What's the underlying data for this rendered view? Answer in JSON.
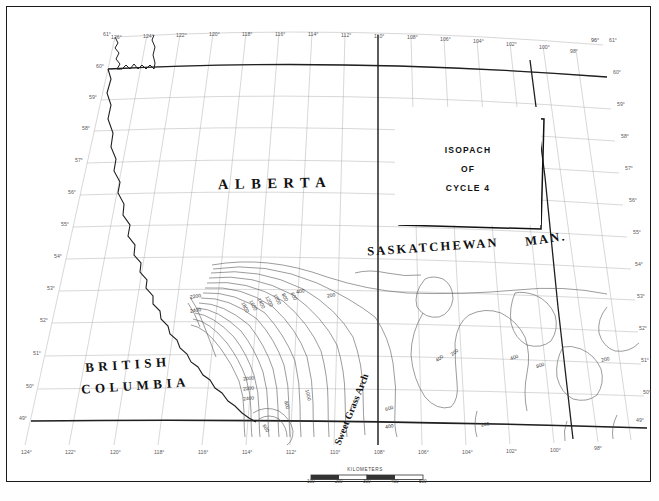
{
  "map": {
    "title_box": {
      "lines": [
        "ISOPACH",
        "OF",
        "CYCLE 4"
      ]
    },
    "provinces": [
      {
        "name": "alberta",
        "label": "ALBERTA"
      },
      {
        "name": "saskatchewan",
        "label": "SASKATCHEWAN"
      },
      {
        "name": "manitoba",
        "label": "MAN."
      },
      {
        "name": "british-columbia-line1",
        "label": "BRITISH"
      },
      {
        "name": "british-columbia-line2",
        "label": "COLUMBIA"
      }
    ],
    "feature_labels": [
      {
        "name": "sweet-grass-arch",
        "label": "Sweet Grass Arch"
      }
    ],
    "longitude_labels_top": [
      "126°",
      "124°",
      "122°",
      "120°",
      "118°",
      "116°",
      "114°",
      "112°",
      "110°",
      "108°",
      "106°",
      "104°",
      "102°",
      "100°",
      "98°",
      "96°"
    ],
    "longitude_labels_bottom": [
      "124°",
      "122°",
      "120°",
      "118°",
      "116°",
      "114°",
      "112°",
      "110°",
      "108°",
      "106°",
      "104°",
      "102°",
      "100°",
      "98°"
    ],
    "latitude_labels_left": [
      "61°",
      "60°",
      "59°",
      "58°",
      "57°",
      "56°",
      "55°",
      "54°",
      "53°",
      "52°",
      "51°",
      "50°",
      "49°"
    ],
    "latitude_labels_right": [
      "61°",
      "60°",
      "59°",
      "58°",
      "57°",
      "56°",
      "55°",
      "54°",
      "53°",
      "52°",
      "51°",
      "50°",
      "49°"
    ],
    "contour_labels": [
      "2200",
      "2400",
      "400",
      "200",
      "1800",
      "1600",
      "1400",
      "1200",
      "1000",
      "800",
      "600",
      "400",
      "200",
      "2000",
      "2200",
      "2400",
      "1000",
      "800",
      "600",
      "400",
      "200",
      "600",
      "400",
      "200",
      "400",
      "800",
      "200"
    ],
    "scale": {
      "title": "KILOMETERS",
      "ticks": [
        "100",
        "200",
        "300",
        "400",
        "500"
      ]
    },
    "colors": {
      "frame": "#1a1a1a",
      "graticule": "#9a9a9a",
      "border": "#222222",
      "contour": "#3c3c3c",
      "text": "#111111"
    }
  }
}
